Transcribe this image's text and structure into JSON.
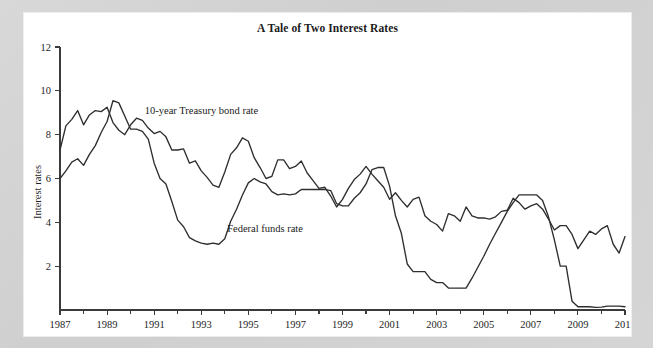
{
  "figure": {
    "title": "A Tale of Two Interest Rates",
    "background_color": "#d4d4d4",
    "card_color": "#ffffff",
    "ink_color": "#2e2e2e"
  },
  "chart_data": {
    "type": "line",
    "title": "A Tale of Two Interest Rates",
    "xlabel": "",
    "ylabel": "Interest rates",
    "xlim": [
      1987,
      2011
    ],
    "ylim": [
      0,
      12
    ],
    "grid": false,
    "legend_position": "inline-annotations",
    "y_ticks": [
      2,
      4,
      6,
      8,
      10,
      12
    ],
    "x_ticks": [
      1987,
      1989,
      1991,
      1993,
      1995,
      1997,
      1999,
      2001,
      2003,
      2005,
      2007,
      2009,
      2011
    ],
    "x_minor_ticks": [
      1988,
      1990,
      1992,
      1994,
      1996,
      1998,
      2000,
      2002,
      2004,
      2006,
      2008,
      2010
    ],
    "annotations": [
      {
        "text": "10-year Treasury bond rate",
        "x": 1990.6,
        "y": 8.95
      },
      {
        "text": "Federal funds rate",
        "x": 1994.1,
        "y": 3.55
      }
    ],
    "series": [
      {
        "name": "10-year Treasury bond rate",
        "color": "#2e2e2e",
        "x": [
          1987.0,
          1987.25,
          1987.5,
          1987.75,
          1988.0,
          1988.25,
          1988.5,
          1988.75,
          1989.0,
          1989.25,
          1989.5,
          1989.75,
          1990.0,
          1990.25,
          1990.5,
          1990.75,
          1991.0,
          1991.25,
          1991.5,
          1991.75,
          1992.0,
          1992.25,
          1992.5,
          1992.75,
          1993.0,
          1993.25,
          1993.5,
          1993.75,
          1994.0,
          1994.25,
          1994.5,
          1994.75,
          1995.0,
          1995.25,
          1995.5,
          1995.75,
          1996.0,
          1996.25,
          1996.5,
          1996.75,
          1997.0,
          1997.25,
          1997.5,
          1997.75,
          1998.0,
          1998.25,
          1998.5,
          1998.75,
          1999.0,
          1999.25,
          1999.5,
          1999.75,
          2000.0,
          2000.25,
          2000.5,
          2000.75,
          2001.0,
          2001.25,
          2001.5,
          2001.75,
          2002.0,
          2002.25,
          2002.5,
          2002.75,
          2003.0,
          2003.25,
          2003.5,
          2003.75,
          2004.0,
          2004.25,
          2004.5,
          2004.75,
          2005.0,
          2005.25,
          2005.5,
          2005.75,
          2006.0,
          2006.25,
          2006.5,
          2006.75,
          2007.0,
          2007.25,
          2007.5,
          2007.75,
          2008.0,
          2008.25,
          2008.5,
          2008.75,
          2009.0,
          2009.25,
          2009.5,
          2009.75,
          2010.0,
          2010.25,
          2010.5,
          2010.75,
          2011.0
        ],
        "y": [
          7.3,
          8.4,
          8.7,
          9.1,
          8.45,
          8.9,
          9.1,
          9.05,
          9.25,
          8.55,
          8.2,
          8.0,
          8.45,
          8.75,
          8.65,
          8.3,
          8.05,
          8.15,
          7.9,
          7.3,
          7.3,
          7.35,
          6.7,
          6.8,
          6.35,
          6.05,
          5.7,
          5.6,
          6.3,
          7.1,
          7.4,
          7.85,
          7.7,
          6.95,
          6.5,
          6.0,
          6.1,
          6.85,
          6.85,
          6.45,
          6.55,
          6.8,
          6.25,
          5.9,
          5.55,
          5.6,
          5.2,
          4.7,
          5.05,
          5.55,
          5.95,
          6.2,
          6.55,
          6.2,
          5.9,
          5.6,
          5.05,
          5.35,
          5.0,
          4.7,
          5.05,
          5.15,
          4.3,
          4.05,
          3.9,
          3.6,
          4.4,
          4.3,
          4.05,
          4.7,
          4.3,
          4.2,
          4.2,
          4.15,
          4.25,
          4.5,
          4.55,
          5.1,
          4.9,
          4.6,
          4.75,
          4.85,
          4.6,
          4.15,
          3.65,
          3.85,
          3.85,
          3.45,
          2.8,
          3.2,
          3.6,
          3.45,
          3.7,
          3.85,
          3.0,
          2.6,
          3.35
        ]
      },
      {
        "name": "Federal funds rate",
        "color": "#2e2e2e",
        "x": [
          1987.0,
          1987.25,
          1987.5,
          1987.75,
          1988.0,
          1988.25,
          1988.5,
          1988.75,
          1989.0,
          1989.25,
          1989.5,
          1989.75,
          1990.0,
          1990.25,
          1990.5,
          1990.75,
          1991.0,
          1991.25,
          1991.5,
          1991.75,
          1992.0,
          1992.25,
          1992.5,
          1992.75,
          1993.0,
          1993.25,
          1993.5,
          1993.75,
          1994.0,
          1994.25,
          1994.5,
          1994.75,
          1995.0,
          1995.25,
          1995.5,
          1995.75,
          1996.0,
          1996.25,
          1996.5,
          1996.75,
          1997.0,
          1997.25,
          1997.5,
          1997.75,
          1998.0,
          1998.25,
          1998.5,
          1998.75,
          1999.0,
          1999.25,
          1999.5,
          1999.75,
          2000.0,
          2000.25,
          2000.5,
          2000.75,
          2001.0,
          2001.25,
          2001.5,
          2001.75,
          2002.0,
          2002.25,
          2002.5,
          2002.75,
          2003.0,
          2003.25,
          2003.5,
          2003.75,
          2004.0,
          2004.25,
          2004.5,
          2004.75,
          2005.0,
          2005.25,
          2005.5,
          2005.75,
          2006.0,
          2006.25,
          2006.5,
          2006.75,
          2007.0,
          2007.25,
          2007.5,
          2007.75,
          2008.0,
          2008.25,
          2008.5,
          2008.75,
          2009.0,
          2009.25,
          2009.5,
          2009.75,
          2010.0,
          2010.25,
          2010.5,
          2010.75,
          2011.0
        ],
        "y": [
          6.0,
          6.35,
          6.75,
          6.9,
          6.6,
          7.1,
          7.5,
          8.1,
          8.6,
          9.55,
          9.45,
          8.85,
          8.25,
          8.25,
          8.15,
          7.8,
          6.7,
          6.0,
          5.75,
          4.95,
          4.1,
          3.8,
          3.3,
          3.15,
          3.05,
          3.0,
          3.05,
          3.0,
          3.25,
          4.05,
          4.6,
          5.25,
          5.8,
          6.0,
          5.85,
          5.75,
          5.4,
          5.25,
          5.3,
          5.25,
          5.3,
          5.5,
          5.5,
          5.5,
          5.5,
          5.5,
          5.45,
          4.85,
          4.75,
          4.75,
          5.1,
          5.35,
          5.75,
          6.4,
          6.5,
          6.5,
          5.65,
          4.3,
          3.5,
          2.1,
          1.75,
          1.75,
          1.75,
          1.4,
          1.25,
          1.25,
          1.0,
          1.0,
          1.0,
          1.0,
          1.45,
          1.95,
          2.45,
          3.0,
          3.5,
          4.0,
          4.5,
          4.9,
          5.25,
          5.25,
          5.25,
          5.25,
          5.0,
          4.25,
          3.2,
          2.0,
          2.0,
          0.4,
          0.15,
          0.15,
          0.15,
          0.12,
          0.13,
          0.18,
          0.18,
          0.18,
          0.15
        ]
      }
    ]
  }
}
